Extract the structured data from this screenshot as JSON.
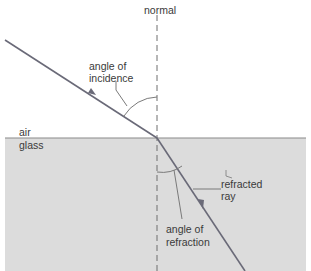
{
  "diagram": {
    "labels": {
      "normal": "normal",
      "incidence_line1": "angle of",
      "incidence_line2": "incidence",
      "air": "air",
      "glass": "glass",
      "refracted_line1": "refracted",
      "refracted_line2": "ray",
      "refraction_line1": "angle of",
      "refraction_line2": "refraction"
    },
    "colors": {
      "background": "#ffffff",
      "glass": "#dcdcdc",
      "ray": "#666677",
      "line": "#7a7a7a",
      "text": "#3a3a3a"
    }
  }
}
